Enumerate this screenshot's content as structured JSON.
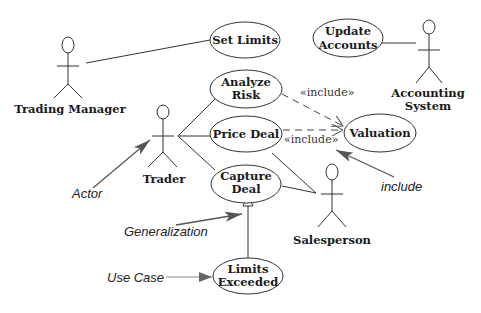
{
  "diagram": {
    "type": "UML use case diagram",
    "actors": [
      {
        "id": "trading-manager",
        "label": "Trading Manager"
      },
      {
        "id": "accounting-system",
        "label_line1": "Accounting",
        "label_line2": "System"
      },
      {
        "id": "trader",
        "label": "Trader"
      },
      {
        "id": "salesperson",
        "label": "Salesperson"
      }
    ],
    "use_cases": [
      {
        "id": "set-limits",
        "line1": "Set Limits"
      },
      {
        "id": "update-accounts",
        "line1": "Update",
        "line2": "Accounts"
      },
      {
        "id": "analyze-risk",
        "line1": "Analyze",
        "line2": "Risk"
      },
      {
        "id": "price-deal",
        "line1": "Price Deal"
      },
      {
        "id": "valuation",
        "line1": "Valuation"
      },
      {
        "id": "capture-deal",
        "line1": "Capture",
        "line2": "Deal"
      },
      {
        "id": "limits-exceeded",
        "line1": "Limits",
        "line2": "Exceeded"
      }
    ],
    "stereotypes": {
      "include_top": "«include»",
      "include_bottom": "«include»"
    },
    "annotations": {
      "actor": "Actor",
      "include": "include",
      "generalization": "Generalization",
      "use_case": "Use Case"
    },
    "colors": {
      "line": "#333333",
      "annotation_arrow": "#555555",
      "background": "#ffffff"
    }
  }
}
